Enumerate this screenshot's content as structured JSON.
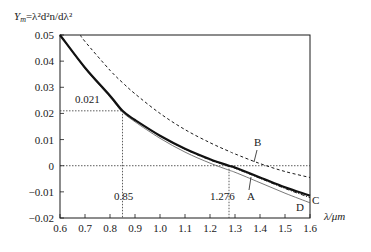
{
  "chart_data": {
    "type": "line",
    "title": "",
    "ylabel": "Y_m = λ²d²n/dλ²",
    "xlabel": "λ/μm",
    "xlim": [
      0.6,
      1.6
    ],
    "ylim": [
      -0.02,
      0.05
    ],
    "grid": false,
    "x_ticks": [
      "0.6",
      "0.7",
      "0.8",
      "0.9",
      "1.0",
      "1.1",
      "1.2",
      "1.3",
      "1.4",
      "1.5",
      "1.6"
    ],
    "y_ticks": [
      "0.05",
      "0.04",
      "0.03",
      "0.02",
      "0.01",
      "0",
      "-0.01",
      "-0.02"
    ],
    "x": [
      0.6,
      0.7,
      0.8,
      0.85,
      0.9,
      1.0,
      1.1,
      1.2,
      1.276,
      1.3,
      1.4,
      1.5,
      1.6
    ],
    "series": [
      {
        "name": "A",
        "style": "solid-thick",
        "values": [
          0.05,
          0.0375,
          0.0268,
          0.021,
          0.0175,
          0.0115,
          0.0065,
          0.0025,
          0.0,
          -0.0007,
          -0.0045,
          -0.0082,
          -0.0115
        ]
      },
      {
        "name": "B",
        "style": "dashed",
        "values": [
          0.061,
          0.0475,
          0.0365,
          0.0318,
          0.0275,
          0.02,
          0.0138,
          0.0088,
          0.0055,
          0.0045,
          0.0008,
          -0.0022,
          -0.0045
        ]
      },
      {
        "name": "C",
        "style": "dash-dot",
        "values": [
          0.05,
          0.0375,
          0.0268,
          0.021,
          0.0175,
          0.0115,
          0.0063,
          0.0022,
          -0.0002,
          -0.001,
          -0.0048,
          -0.0087,
          -0.0122
        ]
      },
      {
        "name": "D",
        "style": "solid-thin",
        "values": [
          0.05,
          0.0372,
          0.0262,
          0.0205,
          0.0168,
          0.0105,
          0.0052,
          0.001,
          -0.0017,
          -0.0025,
          -0.0065,
          -0.0105,
          -0.0142
        ]
      }
    ],
    "annotations": [
      {
        "text": "0.021",
        "x": 0.85,
        "y": 0.021,
        "note": "dotted guide lines at λ=0.85"
      },
      {
        "text": "0.85",
        "x": 0.85,
        "y": -0.012
      },
      {
        "text": "1.276",
        "x": 1.276,
        "y": -0.012,
        "note": "zero crossing of curve A"
      },
      {
        "text": "A",
        "curve": "A"
      },
      {
        "text": "B",
        "curve": "B"
      },
      {
        "text": "C",
        "curve": "C"
      },
      {
        "text": "D",
        "curve": "D"
      }
    ],
    "legend": "inline labels A, B, C, D"
  },
  "labels": {
    "ylabel_prefix": "Y",
    "ylabel_sub": "m",
    "ylabel_rest": "=λ²d²n/dλ²",
    "xlabel": "λ/μm",
    "ann_0021": "0.021",
    "ann_085": "0.85",
    "ann_1276": "1.276",
    "curve_A": "A",
    "curve_B": "B",
    "curve_C": "C",
    "curve_D": "D"
  },
  "colors": {
    "ink": "#1a1a1a",
    "background": "#ffffff"
  }
}
